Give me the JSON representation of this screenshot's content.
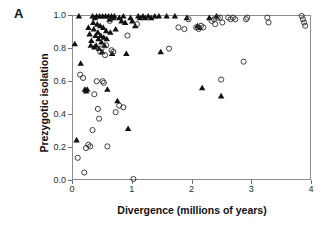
{
  "panel": {
    "letter": "A"
  },
  "axes": {
    "xlabel": "Divergence (millions of years)",
    "ylabel": "Prezygotic isolation",
    "xticks": [
      "0",
      "1",
      "2",
      "3",
      "4"
    ],
    "yticks": [
      "0.0",
      "0.2",
      "0.4",
      "0.6",
      "0.8",
      "1.0"
    ]
  },
  "colors": {
    "marker_fill": "#111111",
    "marker_open_stroke": "#333333",
    "frame": "#8c8c8c",
    "background": "#ffffff",
    "text": "#111111"
  },
  "chart_data": {
    "type": "scatter",
    "title": "",
    "xlabel": "Divergence (millions of years)",
    "ylabel": "Prezygotic isolation",
    "xlim": [
      0,
      4
    ],
    "ylim": [
      0.0,
      1.0
    ],
    "xticks": [
      0,
      1,
      2,
      3,
      4
    ],
    "yticks": [
      0.0,
      0.2,
      0.4,
      0.6,
      0.8,
      1.0
    ],
    "grid": false,
    "legend": "none",
    "series": [
      {
        "name": "allopatric",
        "marker": "filled-triangle",
        "color": "#111111",
        "points": [
          [
            0.03,
            0.83
          ],
          [
            0.06,
            0.24
          ],
          [
            0.1,
            1.0
          ],
          [
            0.13,
            0.71
          ],
          [
            0.2,
            0.55
          ],
          [
            0.22,
            0.54
          ],
          [
            0.24,
            0.55
          ],
          [
            0.26,
            0.93
          ],
          [
            0.28,
            0.89
          ],
          [
            0.3,
            0.82
          ],
          [
            0.31,
            0.85
          ],
          [
            0.33,
            1.0
          ],
          [
            0.34,
            0.96
          ],
          [
            0.35,
            0.92
          ],
          [
            0.36,
            0.81
          ],
          [
            0.37,
            0.99
          ],
          [
            0.38,
            0.88
          ],
          [
            0.39,
            0.82
          ],
          [
            0.4,
            1.0
          ],
          [
            0.41,
            0.95
          ],
          [
            0.42,
            0.9
          ],
          [
            0.43,
            0.86
          ],
          [
            0.44,
            0.8
          ],
          [
            0.45,
            1.0
          ],
          [
            0.46,
            0.94
          ],
          [
            0.47,
            0.88
          ],
          [
            0.48,
            0.84
          ],
          [
            0.49,
            0.78
          ],
          [
            0.5,
            1.0
          ],
          [
            0.51,
            0.93
          ],
          [
            0.52,
            0.87
          ],
          [
            0.53,
            0.82
          ],
          [
            0.55,
            1.0
          ],
          [
            0.56,
            0.91
          ],
          [
            0.57,
            0.86
          ],
          [
            0.58,
            0.55
          ],
          [
            0.6,
            1.0
          ],
          [
            0.62,
            0.98
          ],
          [
            0.63,
            0.9
          ],
          [
            0.65,
            1.0
          ],
          [
            0.66,
            0.77
          ],
          [
            0.68,
            0.99
          ],
          [
            0.7,
            1.0
          ],
          [
            0.72,
            0.92
          ],
          [
            0.75,
            0.48
          ],
          [
            0.78,
            0.99
          ],
          [
            0.82,
            0.97
          ],
          [
            0.85,
            1.0
          ],
          [
            0.88,
            0.96
          ],
          [
            0.9,
            0.77
          ],
          [
            0.93,
            0.31
          ],
          [
            0.97,
            0.99
          ],
          [
            1.0,
            0.97
          ],
          [
            1.05,
            0.94
          ],
          [
            1.1,
            1.0
          ],
          [
            1.13,
            0.99
          ],
          [
            1.18,
            1.0
          ],
          [
            1.22,
            0.99
          ],
          [
            1.27,
            1.0
          ],
          [
            1.32,
            0.99
          ],
          [
            1.38,
            1.0
          ],
          [
            1.45,
            1.0
          ],
          [
            1.48,
            0.78
          ],
          [
            1.58,
            1.0
          ],
          [
            1.72,
            1.0
          ],
          [
            1.92,
            0.99
          ],
          [
            2.1,
            0.94
          ],
          [
            2.14,
            0.93
          ],
          [
            2.18,
            0.56
          ],
          [
            2.3,
            0.99
          ],
          [
            2.42,
            1.0
          ],
          [
            2.5,
            0.51
          ]
        ]
      },
      {
        "name": "sympatric",
        "marker": "open-circle",
        "color": "#333333",
        "points": [
          [
            0.08,
            0.13
          ],
          [
            0.12,
            0.64
          ],
          [
            0.17,
            0.62
          ],
          [
            0.19,
            0.04
          ],
          [
            0.22,
            0.19
          ],
          [
            0.26,
            0.21
          ],
          [
            0.29,
            0.2
          ],
          [
            0.33,
            0.3
          ],
          [
            0.36,
            0.52
          ],
          [
            0.4,
            0.6
          ],
          [
            0.42,
            0.43
          ],
          [
            0.44,
            0.37
          ],
          [
            0.46,
            0.78
          ],
          [
            0.48,
            0.8
          ],
          [
            0.5,
            0.6
          ],
          [
            0.52,
            0.59
          ],
          [
            0.54,
            0.76
          ],
          [
            0.56,
            0.82
          ],
          [
            0.58,
            0.2
          ],
          [
            0.62,
            0.97
          ],
          [
            0.65,
            0.79
          ],
          [
            0.68,
            0.78
          ],
          [
            0.72,
            0.41
          ],
          [
            0.78,
            0.45
          ],
          [
            0.85,
            0.44
          ],
          [
            0.92,
            0.88
          ],
          [
            1.02,
            0.0
          ],
          [
            1.08,
            0.95
          ],
          [
            1.62,
            0.8
          ],
          [
            1.78,
            0.93
          ],
          [
            1.88,
            0.92
          ],
          [
            1.95,
            0.98
          ],
          [
            2.08,
            0.93
          ],
          [
            2.12,
            0.92
          ],
          [
            2.16,
            0.94
          ],
          [
            2.2,
            0.93
          ],
          [
            2.34,
            0.97
          ],
          [
            2.38,
            0.98
          ],
          [
            2.4,
            0.95
          ],
          [
            2.44,
            0.99
          ],
          [
            2.48,
            0.99
          ],
          [
            2.52,
            0.96
          ],
          [
            2.5,
            0.61
          ],
          [
            2.62,
            0.99
          ],
          [
            2.66,
            0.98
          ],
          [
            2.7,
            0.99
          ],
          [
            2.74,
            0.98
          ],
          [
            2.88,
            0.72
          ],
          [
            2.92,
            0.98
          ],
          [
            2.94,
            0.99
          ],
          [
            3.28,
            0.99
          ],
          [
            3.3,
            0.96
          ],
          [
            3.86,
            1.0
          ],
          [
            3.88,
            0.98
          ],
          [
            3.9,
            0.96
          ],
          [
            3.92,
            0.94
          ]
        ]
      }
    ]
  }
}
